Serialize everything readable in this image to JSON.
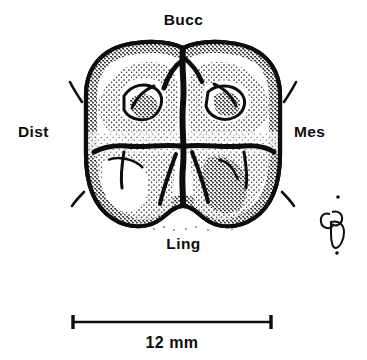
{
  "figure": {
    "type": "scientific-illustration",
    "background_color": "#ffffff",
    "ink_color": "#0d0d0d"
  },
  "labels": {
    "buccal": "Bucc",
    "distal": "Dist",
    "mesial": "Mes",
    "lingual": "Ling"
  },
  "scale": {
    "value": "12",
    "unit": "mm",
    "text": "12  mm",
    "bar_length_px": 198
  },
  "artist_mark": {
    "name": "artist-signature-mark"
  }
}
